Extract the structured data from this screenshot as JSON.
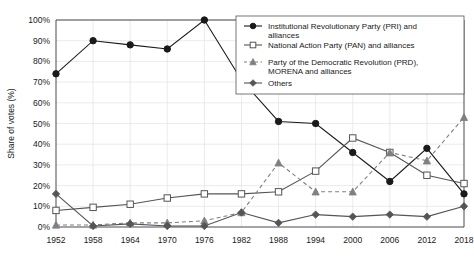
{
  "chart_data": {
    "type": "line",
    "title": "",
    "xlabel": "",
    "ylabel": "Share of votes (%)",
    "categories": [
      "1952",
      "1958",
      "1964",
      "1970",
      "1976",
      "1982",
      "1988",
      "1994",
      "2000",
      "2006",
      "2012",
      "2018"
    ],
    "x": [
      1952,
      1958,
      1964,
      1970,
      1976,
      1982,
      1988,
      1994,
      2000,
      2006,
      2012,
      2018
    ],
    "ylim": [
      0,
      100
    ],
    "xlim": [
      1952,
      2018
    ],
    "grid": true,
    "legend_position": "top-right",
    "ytick_labels": [
      "0%",
      "10%",
      "20%",
      "30%",
      "40%",
      "50%",
      "60%",
      "70%",
      "80%",
      "90%",
      "100%"
    ],
    "ytick_values": [
      0,
      10,
      20,
      30,
      40,
      50,
      60,
      70,
      80,
      90,
      100
    ],
    "series": [
      {
        "name": "Institutional Revolutionary Party (PRI) and alliances",
        "legend_label_line1": "Institutional Revolutionary Party (PRI) and",
        "legend_label_line2": "alliances",
        "marker": "filled-circle",
        "line_style": "solid",
        "color": "#1a1a1a",
        "values": [
          74,
          90,
          88,
          86,
          100,
          71,
          51,
          50,
          36,
          22,
          38,
          16
        ]
      },
      {
        "name": "National Action Party (PAN) and alliances",
        "legend_label_line1": "National Action Party (PAN) and alliances",
        "legend_label_line2": "",
        "marker": "open-square",
        "line_style": "solid",
        "color": "#555555",
        "values": [
          8,
          9.5,
          11,
          14,
          16,
          16,
          17,
          27,
          43,
          36,
          25,
          21
        ]
      },
      {
        "name": "Party of the Democratic Revolution (PRD), MORENA and alliances",
        "legend_label_line1": "Party of the Democratic Revolution (PRD),",
        "legend_label_line2": "MORENA and alliances",
        "marker": "filled-triangle",
        "line_style": "dashed",
        "color": "#808080",
        "values": [
          1,
          1,
          2,
          2,
          3,
          7,
          31,
          17,
          17,
          36,
          32,
          53
        ]
      },
      {
        "name": "Others",
        "legend_label_line1": "Others",
        "legend_label_line2": "",
        "marker": "filled-diamond",
        "line_style": "solid",
        "color": "#555555",
        "values": [
          16,
          0.5,
          1.5,
          0.5,
          0.5,
          7,
          2,
          6,
          5,
          6,
          5,
          10
        ]
      }
    ]
  }
}
